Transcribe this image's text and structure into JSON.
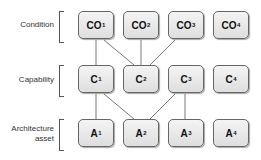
{
  "rows": [
    {
      "label": "Condition",
      "label_lines": [
        "Condition"
      ],
      "nodes": [
        {
          "base": "CO",
          "sub": "1"
        },
        {
          "base": "CO",
          "sub": "2"
        },
        {
          "base": "CO",
          "sub": "3"
        },
        {
          "base": "CO",
          "sub": "4"
        }
      ]
    },
    {
      "label": "Capability",
      "label_lines": [
        "Capability"
      ],
      "nodes": [
        {
          "base": "C",
          "sub": "1"
        },
        {
          "base": "C",
          "sub": "2"
        },
        {
          "base": "C",
          "sub": "3"
        },
        {
          "base": "C",
          "sub": "4"
        }
      ]
    },
    {
      "label": "Architecture asset",
      "label_lines": [
        "Architecture",
        "asset"
      ],
      "nodes": [
        {
          "base": "A",
          "sub": "1"
        },
        {
          "base": "A",
          "sub": "2"
        },
        {
          "base": "A",
          "sub": "3"
        },
        {
          "base": "A",
          "sub": "4"
        }
      ]
    }
  ],
  "edges": [
    [
      "CO1",
      "C1"
    ],
    [
      "CO1",
      "C2"
    ],
    [
      "CO2",
      "C2"
    ],
    [
      "CO3",
      "C2"
    ],
    [
      "C1",
      "A1"
    ],
    [
      "C1",
      "A2"
    ],
    [
      "C3",
      "A2"
    ],
    [
      "C3",
      "A3"
    ]
  ],
  "colors": {
    "node_border": "#666666",
    "node_fill": "#e8e8e8",
    "line": "#555555"
  }
}
